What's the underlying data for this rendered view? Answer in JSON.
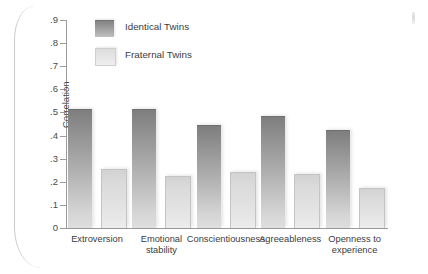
{
  "chart_data": {
    "type": "bar",
    "title": "",
    "xlabel": "",
    "ylabel": "Correlation",
    "ylim": [
      0,
      0.9
    ],
    "ytick_labels": [
      ".9",
      ".8",
      ".7",
      ".6",
      ".5",
      ".4",
      ".3",
      ".2",
      ".1",
      "0"
    ],
    "ytick_values": [
      0.9,
      0.8,
      0.7,
      0.6,
      0.5,
      0.4,
      0.3,
      0.2,
      0.1,
      0
    ],
    "grid": false,
    "legend_position": "top-left-inside",
    "categories": [
      "Extroversion",
      "Emotional stability",
      "Conscientiousness",
      "Agreeableness",
      "Openness to experience"
    ],
    "category_lines": [
      [
        "Extroversion"
      ],
      [
        "Emotional",
        "stability"
      ],
      [
        "Conscientiousness"
      ],
      [
        "Agreeableness"
      ],
      [
        "Openness to",
        "experience"
      ]
    ],
    "series": [
      {
        "name": "Identical Twins",
        "color": "#909090",
        "values": [
          0.51,
          0.51,
          0.44,
          0.48,
          0.42
        ]
      },
      {
        "name": "Fraternal Twins",
        "color": "#e2e2e2",
        "values": [
          0.25,
          0.22,
          0.24,
          0.23,
          0.17
        ]
      }
    ]
  },
  "legend": {
    "items": [
      {
        "label": "Identical Twins",
        "swatch": "identical"
      },
      {
        "label": "Fraternal Twins",
        "swatch": "fraternal"
      }
    ]
  },
  "axis": {
    "y_label": "Correlation"
  }
}
